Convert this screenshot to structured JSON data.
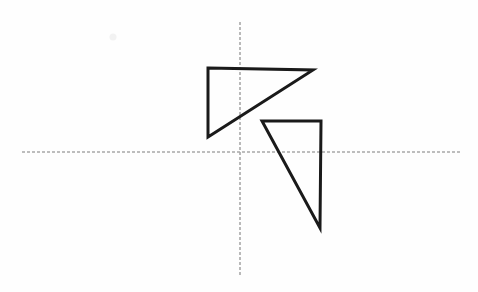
{
  "figure": {
    "canvas": {
      "width": 478,
      "height": 292,
      "background": "#fefefe"
    },
    "axes": {
      "stroke_color": "#a8a8a8",
      "stroke_width": 1.6,
      "dash_pattern": "3 2",
      "horizontal": {
        "label": "x-axis",
        "x1": 22,
        "y1": 152,
        "x2": 462,
        "y2": 152
      },
      "vertical": {
        "label": "y-axis",
        "x1": 240,
        "y1": 22,
        "x2": 240,
        "y2": 277
      },
      "origin": {
        "x": 240,
        "y": 152
      }
    },
    "shapes": [
      {
        "name": "upper-triangle",
        "type": "triangle",
        "stroke_color": "#1a1a1a",
        "stroke_width": 3,
        "fill": "none",
        "points": "208,68 313,70 208,137",
        "vertices": [
          {
            "label": "top-left",
            "x": 208,
            "y": 68
          },
          {
            "label": "top-right",
            "x": 313,
            "y": 70
          },
          {
            "label": "bottom-left",
            "x": 208,
            "y": 137
          }
        ]
      },
      {
        "name": "lower-triangle",
        "type": "triangle",
        "stroke_color": "#1a1a1a",
        "stroke_width": 3,
        "fill": "none",
        "points": "262,121 321,121 320,228",
        "vertices": [
          {
            "label": "top-left",
            "x": 262,
            "y": 121
          },
          {
            "label": "top-right",
            "x": 321,
            "y": 121
          },
          {
            "label": "bottom-right",
            "x": 320,
            "y": 228
          }
        ]
      }
    ],
    "artifacts": [
      {
        "name": "faint-smudge",
        "x": 113,
        "y": 37,
        "r": 3.5,
        "color": "#f2f2f2"
      }
    ]
  }
}
